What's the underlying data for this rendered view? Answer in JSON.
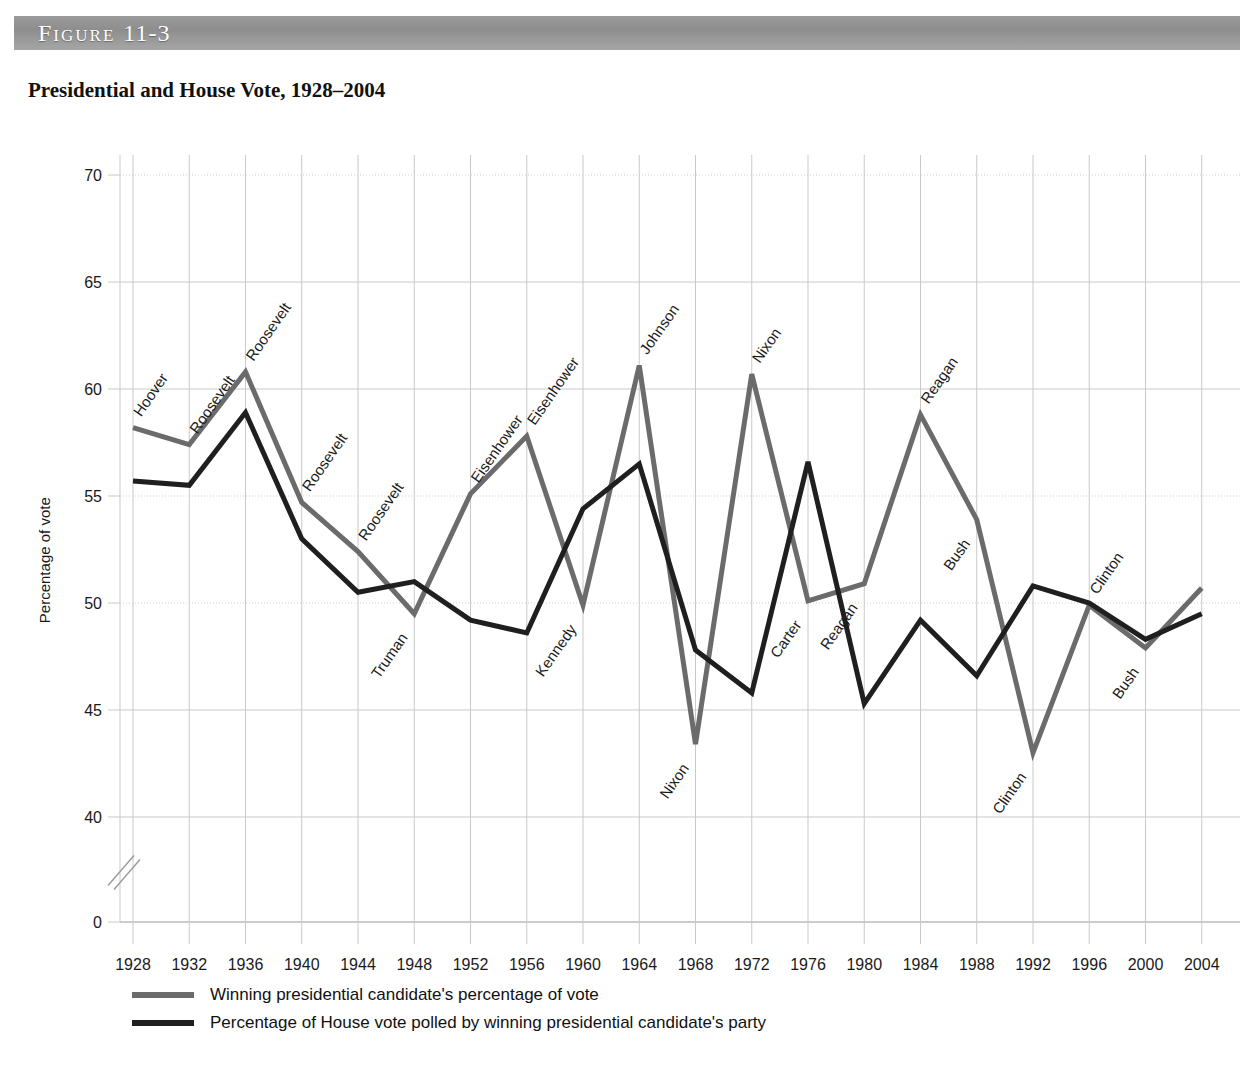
{
  "figure": {
    "bar_label_word": "Figure",
    "bar_label_number": "11-3",
    "title": "Presidential and House Vote, 1928–2004"
  },
  "axes": {
    "ylabel": "Percentage of vote",
    "y_ticks": [
      "70",
      "65",
      "60",
      "55",
      "50",
      "45",
      "40",
      "0"
    ],
    "x_ticks": [
      "1928",
      "1932",
      "1936",
      "1940",
      "1944",
      "1948",
      "1952",
      "1956",
      "1960",
      "1964",
      "1968",
      "1972",
      "1976",
      "1980",
      "1984",
      "1988",
      "1992",
      "1996",
      "2000",
      "2004"
    ]
  },
  "legend": {
    "items": [
      {
        "label": "Winning presidential candidate's percentage of vote",
        "color": "#6b6b6b"
      },
      {
        "label": "Percentage of House vote polled by winning presidential candidate's party",
        "color": "#1f1f1f"
      }
    ]
  },
  "colors": {
    "presidential_line": "#6b6b6b",
    "house_line": "#1f1f1f",
    "grid": "#c9c9c9",
    "header_bar": "#9b9b9b",
    "text": "#1a1a1a"
  },
  "chart_data": {
    "type": "line",
    "title": "Presidential and House Vote, 1928–2004",
    "xlabel": "",
    "ylabel": "Percentage of vote",
    "ylim": [
      40,
      70
    ],
    "y_tick_values": [
      70,
      65,
      60,
      55,
      50,
      45,
      40,
      0
    ],
    "axis_break": true,
    "grid": true,
    "legend_position": "bottom-left",
    "x": [
      1928,
      1932,
      1936,
      1940,
      1944,
      1948,
      1952,
      1956,
      1960,
      1964,
      1968,
      1972,
      1976,
      1980,
      1984,
      1988,
      1992,
      1996,
      2000,
      2004
    ],
    "categories": [
      "1928",
      "1932",
      "1936",
      "1940",
      "1944",
      "1948",
      "1952",
      "1956",
      "1960",
      "1964",
      "1968",
      "1972",
      "1976",
      "1980",
      "1984",
      "1988",
      "1992",
      "1996",
      "2000",
      "2004"
    ],
    "series": [
      {
        "name": "Winning presidential candidate's percentage of vote",
        "color": "#6b6b6b",
        "values": [
          58.2,
          57.4,
          60.8,
          54.7,
          52.4,
          49.5,
          55.1,
          57.8,
          49.9,
          61.1,
          43.4,
          60.7,
          50.1,
          50.9,
          58.8,
          53.9,
          43.0,
          49.9,
          47.9,
          50.7
        ]
      },
      {
        "name": "Percentage of House vote polled by winning presidential candidate's party",
        "color": "#1f1f1f",
        "values": [
          55.7,
          55.5,
          58.9,
          53.0,
          50.5,
          51.0,
          49.2,
          48.6,
          54.4,
          56.5,
          47.8,
          45.8,
          56.6,
          45.3,
          49.2,
          46.6,
          50.8,
          50.0,
          48.3,
          49.5
        ]
      }
    ],
    "annotations": [
      {
        "text": "Hoover",
        "year": 1928,
        "value": 58.2,
        "series": "presidential"
      },
      {
        "text": "Roosevelt",
        "year": 1932,
        "value": 57.4,
        "series": "presidential"
      },
      {
        "text": "Roosevelt",
        "year": 1936,
        "value": 60.8,
        "series": "presidential"
      },
      {
        "text": "Roosevelt",
        "year": 1940,
        "value": 54.7,
        "series": "presidential"
      },
      {
        "text": "Roosevelt",
        "year": 1944,
        "value": 52.4,
        "series": "presidential"
      },
      {
        "text": "Truman",
        "year": 1948,
        "value": 49.5,
        "series": "presidential"
      },
      {
        "text": "Eisenhower",
        "year": 1952,
        "value": 55.1,
        "series": "presidential"
      },
      {
        "text": "Eisenhower",
        "year": 1956,
        "value": 57.8,
        "series": "presidential"
      },
      {
        "text": "Kennedy",
        "year": 1960,
        "value": 49.9,
        "series": "presidential"
      },
      {
        "text": "Johnson",
        "year": 1964,
        "value": 61.1,
        "series": "presidential"
      },
      {
        "text": "Nixon",
        "year": 1968,
        "value": 43.4,
        "series": "presidential"
      },
      {
        "text": "Nixon",
        "year": 1972,
        "value": 60.7,
        "series": "presidential"
      },
      {
        "text": "Carter",
        "year": 1976,
        "value": 50.1,
        "series": "presidential"
      },
      {
        "text": "Reagan",
        "year": 1980,
        "value": 50.9,
        "series": "presidential"
      },
      {
        "text": "Reagan",
        "year": 1984,
        "value": 58.8,
        "series": "presidential"
      },
      {
        "text": "Bush",
        "year": 1988,
        "value": 53.9,
        "series": "presidential"
      },
      {
        "text": "Clinton",
        "year": 1992,
        "value": 43.0,
        "series": "presidential"
      },
      {
        "text": "Clinton",
        "year": 1996,
        "value": 49.9,
        "series": "presidential"
      },
      {
        "text": "Bush",
        "year": 2000,
        "value": 47.9,
        "series": "presidential"
      }
    ]
  }
}
